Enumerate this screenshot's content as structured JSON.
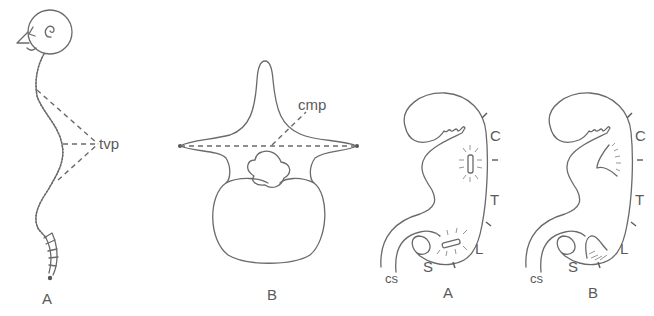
{
  "figure": {
    "panels": [
      {
        "id": "spine-profile",
        "caption": "A",
        "annotation": "tvp"
      },
      {
        "id": "vertebra",
        "caption": "B",
        "annotation": "cmp"
      },
      {
        "id": "embryo-a",
        "caption": "A",
        "region_labels": [
          "C",
          "T",
          "L",
          "S"
        ],
        "bottom_label": "cs"
      },
      {
        "id": "embryo-b",
        "caption": "B",
        "region_labels": [
          "C",
          "T",
          "L",
          "S"
        ],
        "bottom_label": "cs"
      }
    ]
  },
  "colors": {
    "line": "#6a6a6a",
    "text": "#5a5a5a",
    "background": "#ffffff"
  }
}
